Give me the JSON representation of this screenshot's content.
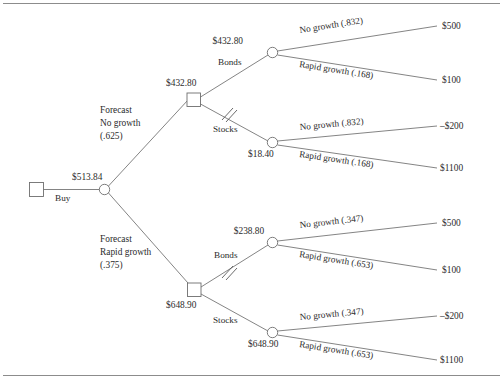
{
  "figure": {
    "type": "decision-tree",
    "title": "",
    "top_rule": true,
    "bottom_rule": true
  },
  "root": {
    "decision_node_label": "",
    "branch_label": "Buy",
    "chance_node_value": "$513.84"
  },
  "forecasts": [
    {
      "id": "no-growth",
      "line1": "Forecast",
      "line2": "No growth",
      "line3": "(.625)",
      "decision_value": "$432.80",
      "alternatives": [
        {
          "id": "bonds",
          "label": "Bonds",
          "pruned": false,
          "node_value": "$432.80",
          "outcomes": [
            {
              "label": "No growth (.832)",
              "payoff": "$500"
            },
            {
              "label": "Rapid growth (.168)",
              "payoff": "$100"
            }
          ]
        },
        {
          "id": "stocks",
          "label": "Stocks",
          "pruned": true,
          "node_value": "$18.40",
          "outcomes": [
            {
              "label": "No growth (.832)",
              "payoff": "–$200"
            },
            {
              "label": "Rapid growth (.168)",
              "payoff": "$1100"
            }
          ]
        }
      ]
    },
    {
      "id": "rapid-growth",
      "line1": "Forecast",
      "line2": "Rapid growth",
      "line3": "(.375)",
      "decision_value": "$648.90",
      "alternatives": [
        {
          "id": "bonds",
          "label": "Bonds",
          "pruned": true,
          "node_value": "$238.80",
          "outcomes": [
            {
              "label": "No growth (.347)",
              "payoff": "$500"
            },
            {
              "label": "Rapid growth (.653)",
              "payoff": "$100"
            }
          ]
        },
        {
          "id": "stocks",
          "label": "Stocks",
          "pruned": false,
          "node_value": "$648.90",
          "outcomes": [
            {
              "label": "No growth (.347)",
              "payoff": "–$200"
            },
            {
              "label": "Rapid growth (.653)",
              "payoff": "$1100"
            }
          ]
        }
      ]
    }
  ],
  "colors": {
    "line": "#6e6e6e",
    "text": "#2b2b2b",
    "rule": "#8c8c8c",
    "background": "#ffffff"
  }
}
